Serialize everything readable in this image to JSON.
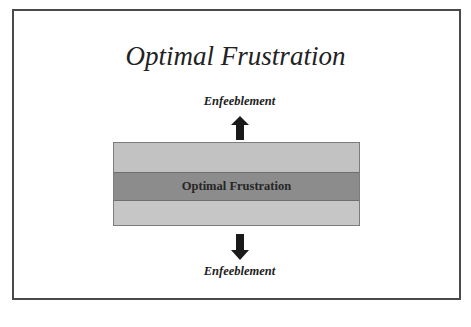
{
  "slide": {
    "title": "Optimal Frustration",
    "top_label": "Enfeeblement",
    "bottom_label": "Enfeeblement",
    "center_band_label": "Optimal Frustration",
    "arrows": [
      {
        "direction": "up",
        "icon": "arrow-up-icon"
      },
      {
        "direction": "down",
        "icon": "arrow-down-icon"
      }
    ],
    "colors": {
      "frame_border": "#4a4a4a",
      "light_band": "#c2c2c2",
      "dark_band": "#8c8c8c",
      "arrow": "#1a1a1a"
    }
  }
}
